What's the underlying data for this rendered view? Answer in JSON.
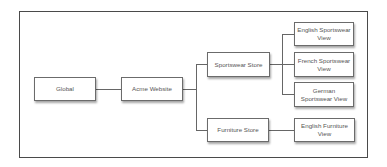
{
  "diagram": {
    "type": "hierarchy-tree",
    "nodes": {
      "global": {
        "label": "Global"
      },
      "acme_website": {
        "label": "Acme Website"
      },
      "sportswear_store": {
        "label": "Sportswear Store"
      },
      "furniture_store": {
        "label": "Furniture Store"
      },
      "english_sportswear_view": {
        "label": "English Sportswear View"
      },
      "french_sportswear_view": {
        "label": "French Sportswear View"
      },
      "german_sportswear_view": {
        "label": "German Sportswear View"
      },
      "english_furniture_view": {
        "label": "English Furniture View"
      }
    },
    "edges": [
      {
        "from": "Global",
        "to": "Acme Website"
      },
      {
        "from": "Acme Website",
        "to": "Sportswear Store"
      },
      {
        "from": "Acme Website",
        "to": "Furniture Store"
      },
      {
        "from": "Sportswear Store",
        "to": "English Sportswear View"
      },
      {
        "from": "Sportswear Store",
        "to": "French Sportswear View"
      },
      {
        "from": "Sportswear Store",
        "to": "German Sportswear View"
      },
      {
        "from": "Furniture Store",
        "to": "English Furniture View"
      }
    ],
    "colors": {
      "frame_border": "#4a4a4a",
      "node_border": "#6b6b6b",
      "node_text": "#555555",
      "connector": "#666666",
      "background": "#ffffff"
    }
  }
}
